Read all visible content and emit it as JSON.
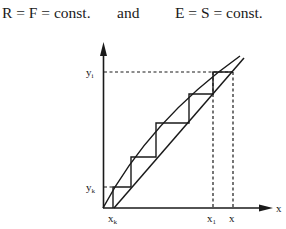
{
  "header": {
    "equation_left": "R = F = const.",
    "connector": "and",
    "equation_right": "E = S = const."
  },
  "diagram": {
    "axes": {
      "x_label": "x",
      "y_label": ""
    },
    "labels": {
      "y_i": "y",
      "y_i_sub": "i",
      "y_k": "y",
      "y_k_sub": "k",
      "x_k": "x",
      "x_k_sub": "k",
      "x_1": "x",
      "x_1_sub": "1",
      "x": "x"
    },
    "curves": [
      "equilibrium-curve",
      "operating-line"
    ],
    "stages": 5,
    "colors": {
      "line": "#1a1a1a",
      "background": "#ffffff"
    }
  }
}
